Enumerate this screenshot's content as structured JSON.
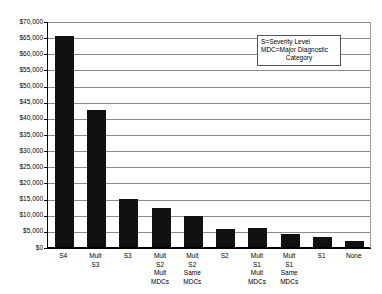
{
  "chart_data": {
    "type": "bar",
    "title": "",
    "subtitle": "",
    "xlabel": "",
    "ylabel": "",
    "ylim": [
      0,
      70000
    ],
    "ytick_step": 5000,
    "grid": true,
    "legend_position": "top-right",
    "categories": [
      "S4",
      "Mult\nS3",
      "S3",
      "Mult\nS2\nMult\nMDCs",
      "Mult\nS2\nSame\nMDCs",
      "S2",
      "Mult\nS1\nMult\nMDCs",
      "Mult\nS1\nSame\nMDCs",
      "S1",
      "None"
    ],
    "values": [
      65500,
      42500,
      15000,
      12200,
      9500,
      5500,
      5800,
      4000,
      3000,
      1800
    ],
    "ytick_labels": [
      "$70,000",
      "$65,000",
      "$60,000",
      "$55,000",
      "$50,000",
      "$45,000",
      "$40,000",
      "$35,000",
      "$30,000",
      "$25,000",
      "$20,000",
      "$15,000",
      "$10,000",
      "$5,000",
      "$0"
    ],
    "ytick_values": [
      70000,
      65000,
      60000,
      55000,
      50000,
      45000,
      40000,
      35000,
      30000,
      25000,
      20000,
      15000,
      10000,
      5000,
      0
    ],
    "annotations": {
      "legend_line_1": "S=Severity Level",
      "legend_line_2": "MDC=Major Diagnostic",
      "legend_line_3": "Category"
    },
    "colors": {
      "bar": "#111111",
      "gridline": "#8c8c8c",
      "axis": "#000000",
      "background": "#ffffff"
    }
  }
}
